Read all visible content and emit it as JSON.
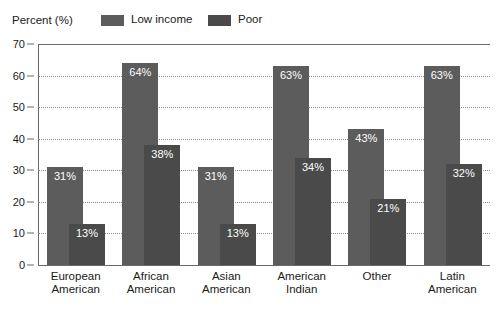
{
  "chart_data": {
    "type": "bar",
    "title": "",
    "subtitle": "",
    "xlabel": "",
    "ylabel": "Percent (%)",
    "ylim": [
      0,
      70
    ],
    "yticks": [
      0,
      10,
      20,
      30,
      40,
      50,
      60,
      70
    ],
    "ytick_labels": [
      "0",
      "10",
      "20",
      "30",
      "40",
      "50",
      "60",
      "70"
    ],
    "grid": true,
    "grid_axis": "y",
    "legend_position": "top",
    "bar_style": "overlapping",
    "categories": [
      "European American",
      "African American",
      "Asian American",
      "American Indian",
      "Other",
      "Latin American"
    ],
    "category_lines": [
      [
        "European",
        "American"
      ],
      [
        "African",
        "American"
      ],
      [
        "Asian",
        "American"
      ],
      [
        "American",
        "Indian"
      ],
      [
        "Other",
        ""
      ],
      [
        "Latin",
        "American"
      ]
    ],
    "series": [
      {
        "name": "Low income",
        "color": "#5c5c5c",
        "values": [
          31,
          64,
          31,
          63,
          43,
          63
        ],
        "labels": [
          "31%",
          "64%",
          "31%",
          "63%",
          "43%",
          "63%"
        ]
      },
      {
        "name": "Poor",
        "color": "#4a4a4a",
        "values": [
          13,
          38,
          13,
          34,
          21,
          32
        ],
        "labels": [
          "13%",
          "38%",
          "13%",
          "34%",
          "21%",
          "32%"
        ]
      }
    ]
  },
  "legend": {
    "axis_title": "Percent (%)",
    "entries": [
      {
        "label": "Low income",
        "color": "#5c5c5c"
      },
      {
        "label": "Poor",
        "color": "#4a4a4a"
      }
    ]
  },
  "colors": {
    "low_income": "#5c5c5c",
    "poor": "#4a4a4a",
    "axis": "#6a6a6a",
    "grid": "#8a8a8a",
    "text": "#1a1a1a",
    "value_text": "#ffffff",
    "background": "#ffffff"
  }
}
